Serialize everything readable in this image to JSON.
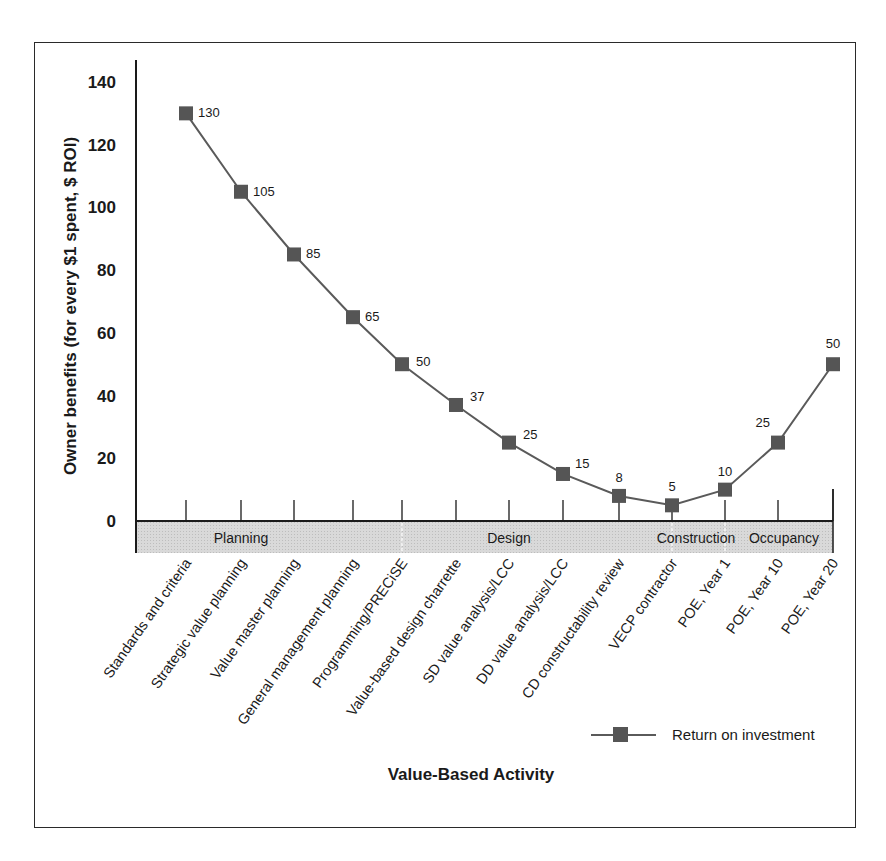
{
  "chart_data": {
    "type": "line",
    "title": "",
    "xlabel": "Value-Based Activity",
    "ylabel": "Owner benefits (for every $1 spent, $ ROI)",
    "ylim": [
      0,
      140
    ],
    "yticks": [
      0,
      20,
      40,
      60,
      80,
      100,
      120,
      140
    ],
    "grid": false,
    "legend_position": "lower right",
    "categories": [
      "Standards and criteria",
      "Strategic value planning",
      "Value master planning",
      "General management planning",
      "Programming/PRECiSE",
      "Value-based design charrette",
      "SD value analysis/LCC",
      "DD value analysis/LCC",
      "CD constructability review",
      "VECP contractor",
      "POE, Year 1",
      "POE, Year 10",
      "POE, Year 20"
    ],
    "series": [
      {
        "name": "Return on investment",
        "values": [
          130,
          105,
          85,
          65,
          50,
          37,
          25,
          15,
          8,
          5,
          10,
          25,
          50
        ],
        "color": "#555555",
        "marker": "square"
      }
    ],
    "phases": [
      {
        "label": "Planning",
        "start_index": 0,
        "end_index": 4
      },
      {
        "label": "Design",
        "start_index": 4,
        "end_index": 9
      },
      {
        "label": "Construction",
        "start_index": 9,
        "end_index": 10
      },
      {
        "label": "Occupancy",
        "start_index": 10,
        "end_index": 12
      }
    ]
  },
  "colors": {
    "line": "#5a5a5a",
    "marker": "#555555",
    "phase_band": "#d6d6d6",
    "axis": "#1a1a1a",
    "frame": "#2a2a2a"
  }
}
